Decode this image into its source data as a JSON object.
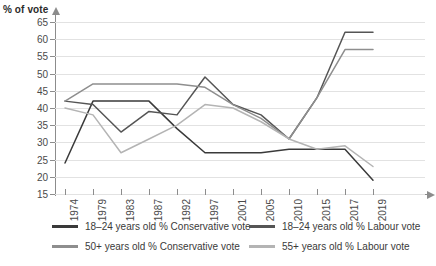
{
  "axis": {
    "y_title": "% of vote",
    "y_ticks": [
      65,
      60,
      55,
      50,
      45,
      40,
      35,
      30,
      25,
      20,
      15
    ],
    "x_ticks": [
      "1974",
      "1979",
      "1983",
      "1987",
      "1992",
      "1997",
      "2001",
      "2005",
      "2010",
      "2015",
      "2017",
      "2019"
    ]
  },
  "legend": {
    "items": [
      {
        "label": "18–24 years old % Conservative vote",
        "color": "#3a3a3a"
      },
      {
        "label": "18–24 years old % Labour vote",
        "color": "#555555"
      },
      {
        "label": "50+ years old % Conservative vote",
        "color": "#8e8e8e"
      },
      {
        "label": "55+ years old % Labour vote",
        "color": "#b4b4b4"
      }
    ]
  },
  "chart_data": {
    "type": "line",
    "title": "",
    "xlabel": "",
    "ylabel": "% of vote",
    "ylim": [
      15,
      65
    ],
    "grid": true,
    "legend_position": "bottom",
    "x": [
      "1974",
      "1979",
      "1983",
      "1987",
      "1992",
      "1997",
      "2001",
      "2005",
      "2010",
      "2015",
      "2017",
      "2019"
    ],
    "series": [
      {
        "name": "18–24 years old % Conservative vote",
        "color": "#3a3a3a",
        "values": [
          24,
          42,
          42,
          42,
          34,
          27,
          27,
          27,
          28,
          28,
          28,
          19
        ]
      },
      {
        "name": "18–24 years old % Labour vote",
        "color": "#555555",
        "values": [
          42,
          41,
          33,
          39,
          38,
          49,
          41,
          38,
          31,
          43,
          62,
          62
        ]
      },
      {
        "name": "50+ years old % Conservative vote",
        "color": "#8e8e8e",
        "values": [
          42,
          47,
          47,
          47,
          47,
          46,
          41,
          37,
          31,
          43,
          57,
          57
        ]
      },
      {
        "name": "55+ years old % Labour vote",
        "color": "#b4b4b4",
        "values": [
          40,
          38,
          27,
          31,
          35,
          41,
          40,
          36,
          31,
          28,
          29,
          23
        ]
      }
    ]
  }
}
